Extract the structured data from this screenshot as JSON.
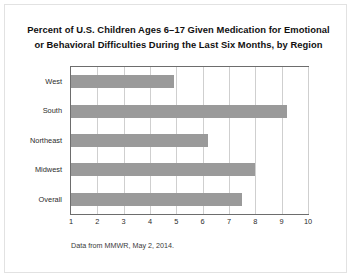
{
  "chart_data": {
    "type": "bar",
    "orientation": "horizontal",
    "title": "Percent of U.S. Children Ages 6–17 Given Medication for Emotional or Behavioral Difficulties During the Last Six Months, by Region",
    "title_lines": [
      "Percent of U.S. Children Ages 6–17 Given Medication for Emotional",
      "or Behavioral Difficulties During the Last Six Months, by Region"
    ],
    "categories": [
      "West",
      "South",
      "Northeast",
      "Midwest",
      "Overall"
    ],
    "values": [
      4.9,
      9.2,
      6.2,
      8.0,
      7.5
    ],
    "xlabel": "",
    "ylabel": "",
    "xlim": [
      1,
      10
    ],
    "xticks": [
      1,
      2,
      3,
      4,
      5,
      6,
      7,
      8,
      9,
      10
    ],
    "xtick_labels": [
      "1",
      "2",
      "3",
      "4",
      "5",
      "6",
      "7",
      "8",
      "9",
      "10"
    ],
    "grid": "vertical",
    "legend": "none",
    "source_note": "Data from MMWR, May 2, 2014.",
    "colors": {
      "bar": "#9a9a9a",
      "gridline": "#cfcfcf",
      "plot_border": "#6d6d6d",
      "plot_background": "#ffffff",
      "figure_background": "#ffffff",
      "figure_border": "#e2e2e2",
      "title_text": "#111111",
      "axis_text": "#2b2b2b",
      "note_text": "#3a3a3a"
    }
  }
}
